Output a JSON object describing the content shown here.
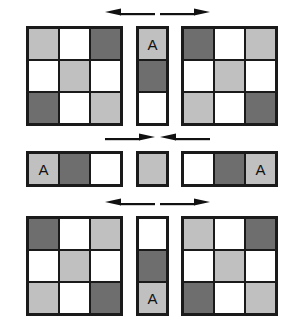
{
  "diagram": {
    "colors": {
      "white": "#ffffff",
      "light_gray": "#c0c0c0",
      "dark_gray": "#6e6e6e",
      "stroke": "#1a1a1a",
      "background": "#ffffff"
    },
    "label_glyph": "A",
    "rows": [
      {
        "id": "row-1",
        "arrows": {
          "left": "arrow-left",
          "right": "arrow-right",
          "direction": "outward"
        },
        "left": {
          "shape": "grid-3x3",
          "cells": [
            [
              "light_gray",
              "white",
              "dark_gray"
            ],
            [
              "white",
              "light_gray",
              "white"
            ],
            [
              "dark_gray",
              "white",
              "light_gray"
            ]
          ],
          "labels": [
            [
              "",
              "",
              ""
            ],
            [
              "",
              "",
              ""
            ],
            [
              "",
              "",
              ""
            ]
          ]
        },
        "center": {
          "shape": "strip-1x3",
          "cells": [
            [
              "light_gray"
            ],
            [
              "dark_gray"
            ],
            [
              "white"
            ]
          ],
          "labels": [
            [
              "A"
            ],
            [
              ""
            ],
            [
              ""
            ]
          ]
        },
        "right": {
          "shape": "grid-3x3",
          "cells": [
            [
              "dark_gray",
              "white",
              "light_gray"
            ],
            [
              "white",
              "light_gray",
              "white"
            ],
            [
              "light_gray",
              "white",
              "dark_gray"
            ]
          ],
          "labels": [
            [
              "",
              "",
              ""
            ],
            [
              "",
              "",
              ""
            ],
            [
              "",
              "",
              ""
            ]
          ]
        }
      },
      {
        "id": "row-2",
        "arrows": {
          "left": "arrow-right",
          "right": "arrow-left",
          "direction": "inward"
        },
        "left": {
          "shape": "strip-3x1",
          "cells": [
            [
              "light_gray",
              "dark_gray",
              "white"
            ]
          ],
          "labels": [
            [
              "A",
              "",
              ""
            ]
          ]
        },
        "center": {
          "shape": "single-cell",
          "cells": [
            [
              "light_gray"
            ]
          ],
          "labels": [
            [
              ""
            ]
          ]
        },
        "right": {
          "shape": "strip-3x1",
          "cells": [
            [
              "white",
              "dark_gray",
              "light_gray"
            ]
          ],
          "labels": [
            [
              "",
              "",
              "A"
            ]
          ]
        }
      },
      {
        "id": "row-3",
        "arrows": {
          "left": "arrow-left",
          "right": "arrow-right",
          "direction": "outward"
        },
        "left": {
          "shape": "grid-3x3",
          "cells": [
            [
              "dark_gray",
              "white",
              "light_gray"
            ],
            [
              "white",
              "light_gray",
              "white"
            ],
            [
              "light_gray",
              "white",
              "dark_gray"
            ]
          ],
          "labels": [
            [
              "",
              "",
              ""
            ],
            [
              "",
              "",
              ""
            ],
            [
              "",
              "",
              ""
            ]
          ]
        },
        "center": {
          "shape": "strip-1x3",
          "cells": [
            [
              "white"
            ],
            [
              "dark_gray"
            ],
            [
              "light_gray"
            ]
          ],
          "labels": [
            [
              ""
            ],
            [
              ""
            ],
            [
              "A"
            ]
          ]
        },
        "right": {
          "shape": "grid-3x3",
          "cells": [
            [
              "light_gray",
              "white",
              "dark_gray"
            ],
            [
              "white",
              "light_gray",
              "white"
            ],
            [
              "dark_gray",
              "white",
              "light_gray"
            ]
          ],
          "labels": [
            [
              "",
              "",
              ""
            ],
            [
              "",
              "",
              ""
            ],
            [
              "",
              "",
              ""
            ]
          ]
        }
      }
    ]
  }
}
